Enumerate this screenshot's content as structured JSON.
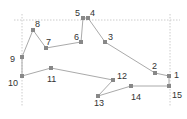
{
  "diagram": {
    "type": "numbered-point-polygon",
    "colors": {
      "line": "#aaaaaa",
      "point": "#888888",
      "guide": "#cccccc",
      "label": "#333333"
    },
    "guides": {
      "horizontal": {
        "y": 20,
        "x1": 14,
        "x2": 180
      },
      "vertical_left": {
        "x": 22,
        "y1": 14,
        "y2": 106
      },
      "vertical_right": {
        "x": 170,
        "y1": 14,
        "y2": 106
      }
    },
    "points": [
      {
        "id": "1",
        "x": 169,
        "y": 76,
        "lx": 174,
        "ly": 76
      },
      {
        "id": "2",
        "x": 155,
        "y": 73,
        "lx": 152,
        "ly": 67
      },
      {
        "id": "3",
        "x": 105,
        "y": 42,
        "lx": 108,
        "ly": 38
      },
      {
        "id": "4",
        "x": 88,
        "y": 18,
        "lx": 90,
        "ly": 14
      },
      {
        "id": "5",
        "x": 83,
        "y": 18,
        "lx": 75,
        "ly": 14
      },
      {
        "id": "6",
        "x": 81,
        "y": 42,
        "lx": 74,
        "ly": 38
      },
      {
        "id": "7",
        "x": 46,
        "y": 48,
        "lx": 46,
        "ly": 43
      },
      {
        "id": "8",
        "x": 33,
        "y": 30,
        "lx": 35,
        "ly": 25
      },
      {
        "id": "9",
        "x": 22,
        "y": 57,
        "lx": 10,
        "ly": 60
      },
      {
        "id": "10",
        "x": 22,
        "y": 76,
        "lx": 8,
        "ly": 84
      },
      {
        "id": "11",
        "x": 51,
        "y": 68,
        "lx": 47,
        "ly": 80
      },
      {
        "id": "12",
        "x": 113,
        "y": 80,
        "lx": 117,
        "ly": 77
      },
      {
        "id": "13",
        "x": 98,
        "y": 96,
        "lx": 94,
        "ly": 104
      },
      {
        "id": "14",
        "x": 131,
        "y": 86,
        "lx": 131,
        "ly": 98
      },
      {
        "id": "15",
        "x": 169,
        "y": 86,
        "lx": 172,
        "ly": 96
      }
    ],
    "edges": [
      [
        "1",
        "2"
      ],
      [
        "2",
        "3"
      ],
      [
        "3",
        "4"
      ],
      [
        "4",
        "5"
      ],
      [
        "5",
        "6"
      ],
      [
        "6",
        "7"
      ],
      [
        "7",
        "8"
      ],
      [
        "8",
        "9"
      ],
      [
        "9",
        "10"
      ],
      [
        "10",
        "11"
      ],
      [
        "11",
        "12"
      ],
      [
        "12",
        "13"
      ],
      [
        "13",
        "14"
      ],
      [
        "14",
        "15"
      ],
      [
        "15",
        "1"
      ]
    ]
  }
}
